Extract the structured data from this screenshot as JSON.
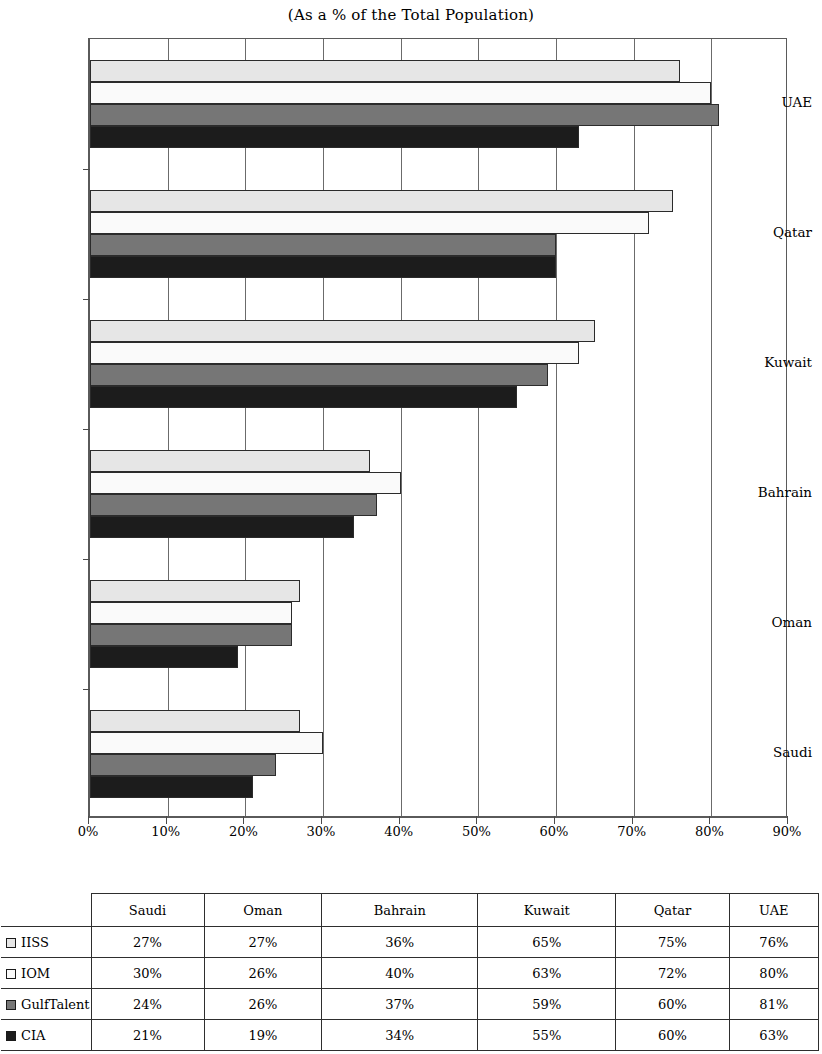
{
  "chart_data": {
    "type": "bar",
    "orientation": "horizontal",
    "title": "(As a % of the Total Population)",
    "xlabel": "",
    "ylabel": "",
    "xlim": [
      0,
      90
    ],
    "xtick_labels": [
      "0%",
      "10%",
      "20%",
      "30%",
      "40%",
      "50%",
      "60%",
      "70%",
      "80%",
      "90%"
    ],
    "xtick_values": [
      0,
      10,
      20,
      30,
      40,
      50,
      60,
      70,
      80,
      90
    ],
    "grid": "vertical",
    "legend_position": "table-left-column",
    "categories": [
      "Saudi",
      "Oman",
      "Bahrain",
      "Kuwait",
      "Qatar",
      "UAE"
    ],
    "categories_top_to_bottom": [
      "UAE",
      "Qatar",
      "Kuwait",
      "Bahrain",
      "Oman",
      "Saudi"
    ],
    "series": [
      {
        "name": "IISS",
        "color": "#e6e6e6",
        "values": [
          27,
          27,
          36,
          65,
          75,
          76
        ]
      },
      {
        "name": "IOM",
        "color": "#fafafa",
        "values": [
          30,
          26,
          40,
          63,
          72,
          80
        ]
      },
      {
        "name": "GulfTalent",
        "color": "#767676",
        "values": [
          24,
          26,
          37,
          59,
          60,
          81
        ]
      },
      {
        "name": "CIA",
        "color": "#1c1c1c",
        "values": [
          21,
          19,
          34,
          55,
          60,
          63
        ]
      }
    ]
  },
  "table": {
    "corner_label": "",
    "column_headers": [
      "Saudi",
      "Oman",
      "Bahrain",
      "Kuwait",
      "Qatar",
      "UAE"
    ],
    "rows": [
      {
        "label": "IISS",
        "swatch": "#e6e6e6",
        "cells": [
          "27%",
          "27%",
          "36%",
          "65%",
          "75%",
          "76%"
        ]
      },
      {
        "label": "IOM",
        "swatch": "#fafafa",
        "cells": [
          "30%",
          "26%",
          "40%",
          "63%",
          "72%",
          "80%"
        ]
      },
      {
        "label": "GulfTalent",
        "swatch": "#767676",
        "cells": [
          "24%",
          "26%",
          "37%",
          "59%",
          "60%",
          "81%"
        ]
      },
      {
        "label": "CIA",
        "swatch": "#1c1c1c",
        "cells": [
          "21%",
          "19%",
          "34%",
          "55%",
          "60%",
          "63%"
        ]
      }
    ]
  }
}
